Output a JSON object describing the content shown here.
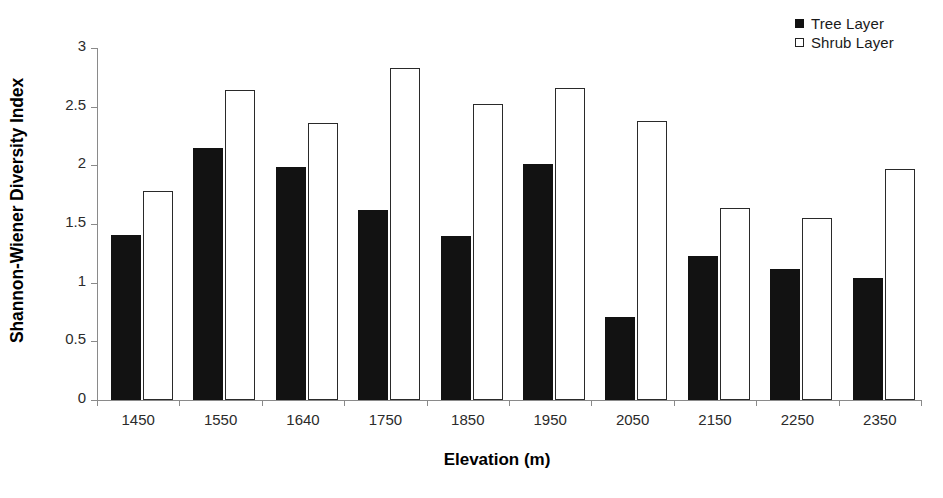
{
  "chart_data": {
    "type": "bar",
    "title": "",
    "xlabel": "Elevation (m)",
    "ylabel": "Shannon-Wiener Diversity Index",
    "categories": [
      "1450",
      "1550",
      "1640",
      "1750",
      "1850",
      "1950",
      "2050",
      "2150",
      "2250",
      "2350"
    ],
    "series": [
      {
        "name": "Tree Layer",
        "color": "#121212",
        "style": "filled",
        "values": [
          1.41,
          2.15,
          1.99,
          1.62,
          1.4,
          2.01,
          0.71,
          1.23,
          1.12,
          1.04
        ]
      },
      {
        "name": "Shrub Layer",
        "color": "#ffffff",
        "style": "open",
        "values": [
          1.78,
          2.64,
          2.36,
          2.83,
          2.52,
          2.66,
          2.38,
          1.64,
          1.55,
          1.97
        ]
      }
    ],
    "ylim": [
      0,
      3
    ],
    "yticks": [
      0,
      0.5,
      1,
      1.5,
      2,
      2.5,
      3
    ],
    "ytick_labels": [
      "0",
      "0.5",
      "1",
      "1.5",
      "2",
      "2.5",
      "3"
    ],
    "grid": false,
    "legend_position": "top-right"
  },
  "legend": {
    "items": [
      {
        "label": "Tree Layer",
        "marker": "filled-square-icon"
      },
      {
        "label": "Shrub Layer",
        "marker": "open-square-icon"
      }
    ]
  },
  "axes": {
    "y_title": "Shannon-Wiener Diversity Index",
    "x_title": "Elevation (m)"
  }
}
